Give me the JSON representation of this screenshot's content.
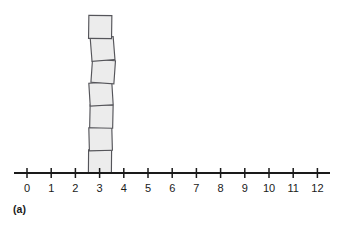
{
  "figure": {
    "panel_label": "(a)",
    "background_color": "#ffffff",
    "width": 337,
    "height": 226
  },
  "style": {
    "square_fill": "#ececec",
    "square_stroke": "#55555a",
    "axis_color": "#1a1a1a",
    "tick_color": "#1a1a1a",
    "label_color": "#1a1a1a"
  },
  "chart_data": {
    "type": "bar",
    "title": "",
    "subtitle": "",
    "xlabel": "",
    "ylabel": "",
    "annotations": [
      "(a)"
    ],
    "grid": false,
    "legend": null,
    "orientation": "vertical",
    "categories": [
      "0",
      "1",
      "2",
      "3",
      "4",
      "5",
      "6",
      "7",
      "8",
      "9",
      "10",
      "11",
      "12"
    ],
    "values": [
      0,
      0,
      0,
      7,
      0,
      0,
      0,
      0,
      0,
      0,
      0,
      0,
      0
    ],
    "xlim": [
      0,
      12
    ],
    "ylim": [
      0,
      7
    ],
    "xticks": [
      "0",
      "1",
      "2",
      "3",
      "4",
      "5",
      "6",
      "7",
      "8",
      "9",
      "10",
      "11",
      "12"
    ],
    "yticks": [],
    "stack": {
      "at_value": 3,
      "count": 7,
      "unit": "square block",
      "blocks": [
        {
          "index": 1,
          "cx": 100.0,
          "cy": 161.5,
          "size": 23.0,
          "rotation": 0.5
        },
        {
          "index": 2,
          "cx": 100.6,
          "cy": 139.0,
          "size": 23.0,
          "rotation": -1.5
        },
        {
          "index": 3,
          "cx": 101.4,
          "cy": 116.5,
          "size": 23.0,
          "rotation": 1.2
        },
        {
          "index": 4,
          "cx": 101.0,
          "cy": 94.0,
          "size": 23.0,
          "rotation": -3.5
        },
        {
          "index": 5,
          "cx": 103.2,
          "cy": 71.5,
          "size": 23.0,
          "rotation": 4.0
        },
        {
          "index": 6,
          "cx": 102.6,
          "cy": 49.0,
          "size": 23.0,
          "rotation": -4.5
        },
        {
          "index": 7,
          "cx": 100.2,
          "cy": 27.0,
          "size": 23.0,
          "rotation": 0.8
        }
      ]
    }
  },
  "axis": {
    "line_y": 173,
    "line_x_start": 14,
    "line_x_end": 330,
    "tick_origin_x": 27,
    "tick_spacing": 24.2,
    "tick_label_y": 192,
    "tick_half_length": 5
  }
}
